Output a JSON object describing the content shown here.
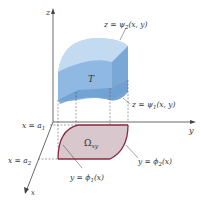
{
  "figure": {
    "axes": {
      "z_label": "z",
      "y_label": "y",
      "x_label": "x"
    },
    "solid": {
      "label": "T",
      "color": "#9cc2e6",
      "side_color": "#7fadd9",
      "top_color": "#b8d4ee"
    },
    "region": {
      "label": "Ω",
      "label_sub": "xy",
      "fill": "#d6c5cb",
      "boundary_color": "#8b2a43"
    },
    "surfaces": {
      "upper": {
        "pre": "z = ψ",
        "sub": "2",
        "post": "(x, y)"
      },
      "lower": {
        "pre": "z = ψ",
        "sub": "1",
        "post": "(x, y)"
      }
    },
    "bounds": {
      "a1": {
        "pre": "x = a",
        "sub": "1"
      },
      "a2": {
        "pre": "x = a",
        "sub": "2"
      }
    },
    "curves": {
      "phi1": {
        "pre": "y = ϕ",
        "sub": "1",
        "post": "(x)"
      },
      "phi2": {
        "pre": "y = ϕ",
        "sub": "2",
        "post": "(x)"
      }
    }
  }
}
